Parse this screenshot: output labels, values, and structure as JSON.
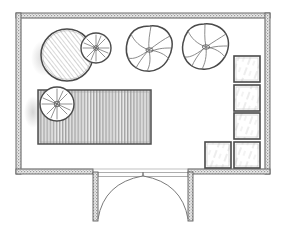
{
  "drawing": {
    "title": "Hand-drawn architectural floor plan",
    "style": "pencil sketch, monochrome line drawing",
    "canvas": {
      "width": 284,
      "height": 239
    },
    "colors": {
      "paper": "#ffffff",
      "ink": "#555555",
      "ink_dark": "#3f3f3f",
      "ink_light": "#8d8d8d",
      "wall_fill": "#b9b9b9",
      "hatch": "#7b7b7b"
    }
  },
  "room": {
    "label": "main-room",
    "outer": {
      "x": 16,
      "y": 13,
      "width": 254,
      "height": 161
    },
    "wall_thickness": 5,
    "inner": {
      "x": 21,
      "y": 18,
      "width": 244,
      "height": 151
    }
  },
  "entrance": {
    "label": "double-door-entry",
    "opening": {
      "x_start": 93,
      "x_end": 193,
      "y": 172
    },
    "stub_left": {
      "x": 93,
      "y": 172,
      "width": 5,
      "height": 49
    },
    "stub_right": {
      "x": 188,
      "y": 172,
      "width": 5,
      "height": 49
    },
    "threshold": {
      "x": 98,
      "y": 173,
      "width": 90,
      "height": 4
    },
    "door_count": 2,
    "swing": "outward",
    "leaf_left": {
      "hinge_x": 98,
      "hinge_y": 218,
      "tip_x": 143,
      "tip_y": 175
    },
    "leaf_right": {
      "hinge_x": 188,
      "hinge_y": 218,
      "tip_x": 143,
      "tip_y": 175
    }
  },
  "furniture": [
    {
      "id": "round-table",
      "name": "round-table",
      "symbol": "circle-diagonal-hatch",
      "cx": 67,
      "cy": 55,
      "r": 26,
      "hatch": "diagonal"
    },
    {
      "id": "potted-plant-upper",
      "name": "potted-plant-upper",
      "symbol": "circle-radial-burst",
      "cx": 96,
      "cy": 48,
      "r": 15,
      "hatch": "radial"
    },
    {
      "id": "tree-center",
      "name": "tree-canopy-center",
      "symbol": "tree-blob",
      "cx": 150,
      "cy": 49,
      "r": 23
    },
    {
      "id": "tree-right",
      "name": "tree-canopy-right",
      "symbol": "tree-blob",
      "cx": 205,
      "cy": 47,
      "r": 23
    },
    {
      "id": "rug",
      "name": "rug-or-long-table",
      "symbol": "rectangle-vertical-hatch",
      "x": 38,
      "y": 90,
      "width": 113,
      "height": 54,
      "hatch": "vertical"
    },
    {
      "id": "potted-plant-lower",
      "name": "potted-plant-lower",
      "symbol": "circle-radial-burst",
      "cx": 57,
      "cy": 104,
      "r": 17,
      "hatch": "radial"
    }
  ],
  "seating": {
    "name": "seating-squares",
    "symbol": "square-sparse-hatch",
    "count": 5,
    "squares": [
      {
        "id": "seat-1",
        "name": "seat-square-1",
        "x": 234,
        "y": 56,
        "size": 26
      },
      {
        "id": "seat-2",
        "name": "seat-square-2",
        "x": 234,
        "y": 85,
        "size": 26
      },
      {
        "id": "seat-3",
        "name": "seat-square-3",
        "x": 234,
        "y": 113,
        "size": 26
      },
      {
        "id": "seat-4",
        "name": "seat-square-4",
        "x": 234,
        "y": 142,
        "size": 26
      },
      {
        "id": "seat-5",
        "name": "seat-square-5",
        "x": 205,
        "y": 142,
        "size": 26
      }
    ]
  }
}
